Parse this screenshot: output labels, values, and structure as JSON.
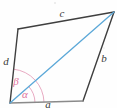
{
  "figure": {
    "kind": "quadrilateral-with-diagonal",
    "canvas": {
      "width": 117,
      "height": 108
    },
    "colors": {
      "outline": "#3f3f3f",
      "baseline": "#8a8a8a",
      "diagonal": "#5ba8d8",
      "angle_arc": "#e5a0bb",
      "angle_label": "#e0739c",
      "label_text": "#3b3b3b",
      "background": "#fefefe"
    },
    "vertices": {
      "bottom_left": {
        "x": 10,
        "y": 103
      },
      "top_left": {
        "x": 18,
        "y": 29
      },
      "top_right": {
        "x": 114,
        "y": 12
      },
      "bottom_right": {
        "x": 83,
        "y": 101
      }
    },
    "edges": [
      {
        "name": "side-a",
        "label": "a",
        "from": "bottom_left",
        "to": "bottom_right",
        "label_x": 48,
        "label_y": 108,
        "color": "#8a8a8a"
      },
      {
        "name": "side-b",
        "label": "b",
        "from": "bottom_right",
        "to": "top_right",
        "label_x": 104,
        "label_y": 62,
        "color": "#3f3f3f"
      },
      {
        "name": "side-c",
        "label": "c",
        "from": "top_right",
        "to": "top_left",
        "label_x": 62,
        "label_y": 17,
        "color": "#3f3f3f"
      },
      {
        "name": "side-d",
        "label": "d",
        "from": "top_left",
        "to": "bottom_left",
        "label_x": 6,
        "label_y": 65,
        "color": "#3f3f3f"
      }
    ],
    "diagonal": {
      "name": "diagonal",
      "from": "bottom_left",
      "to": "top_right",
      "color": "#5ba8d8"
    },
    "angles": [
      {
        "name": "angle-alpha",
        "label": "α",
        "at": "bottom_left",
        "between": [
          "side-a",
          "diagonal"
        ],
        "radius": 25,
        "label_x": 25,
        "label_y": 98
      },
      {
        "name": "angle-beta",
        "label": "β",
        "at": "bottom_left",
        "between": [
          "diagonal",
          "side-d"
        ],
        "radius": 34,
        "label_x": 16,
        "label_y": 85
      }
    ]
  }
}
